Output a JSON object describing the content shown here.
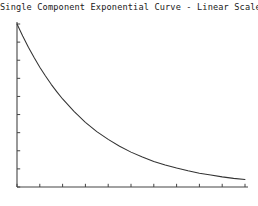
{
  "chart_data": {
    "type": "line",
    "title": "Single Component Exponential Curve - Linear Scale",
    "xlabel": "",
    "ylabel": "",
    "grid": false,
    "legend": false,
    "legend_position": "none",
    "x_tick_labels": [],
    "y_tick_labels": [],
    "x_tick_count": 11,
    "y_tick_count": 10,
    "xlim": [
      0,
      10
    ],
    "ylim": [
      0,
      1
    ],
    "series": [
      {
        "name": "exponential decay",
        "color": "#333333",
        "x": [
          0,
          0.25,
          0.5,
          0.75,
          1,
          1.25,
          1.5,
          1.75,
          2,
          2.5,
          3,
          3.5,
          4,
          4.5,
          5,
          5.5,
          6,
          6.5,
          7,
          7.5,
          8,
          8.5,
          9,
          9.5,
          10
        ],
        "y": [
          1.0,
          0.926,
          0.857,
          0.794,
          0.735,
          0.681,
          0.63,
          0.584,
          0.54,
          0.464,
          0.397,
          0.34,
          0.292,
          0.25,
          0.214,
          0.184,
          0.157,
          0.135,
          0.116,
          0.099,
          0.085,
          0.073,
          0.062,
          0.053,
          0.046
        ]
      }
    ]
  },
  "figure": {
    "background_color": "#ffffff",
    "axis_color": "#444444",
    "title_color": "#1a1a1a"
  }
}
